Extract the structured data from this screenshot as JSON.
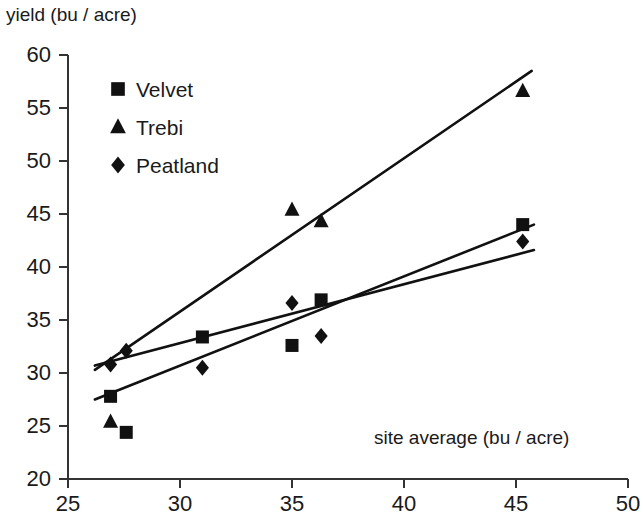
{
  "chart_data": {
    "type": "scatter",
    "title": "",
    "ylabel": "yield (bu / acre)",
    "xlabel": "site average (bu / acre)",
    "xlim": [
      25,
      50
    ],
    "ylim": [
      20,
      60
    ],
    "xticks": [
      25,
      30,
      35,
      40,
      45,
      50
    ],
    "yticks": [
      20,
      25,
      30,
      35,
      40,
      45,
      50,
      55,
      60
    ],
    "xtick_labels": [
      "25",
      "30",
      "35",
      "40",
      "45",
      "50"
    ],
    "ytick_labels": [
      "20",
      "25",
      "30",
      "35",
      "40",
      "45",
      "50",
      "55",
      "60"
    ],
    "grid": false,
    "legend_position": "upper-left-inside",
    "marker_color": "#111111",
    "line_color": "#111111",
    "axis_color": "#333333",
    "series": [
      {
        "name": "Velvet",
        "marker": "square",
        "x": [
          26.9,
          27.6,
          31.0,
          35.0,
          36.3,
          45.3
        ],
        "y": [
          27.8,
          24.4,
          33.4,
          32.6,
          36.9,
          44.0
        ],
        "trendline": {
          "x1": 26.2,
          "y1": 27.5,
          "x2": 45.8,
          "y2": 44.0
        }
      },
      {
        "name": "Trebi",
        "marker": "triangle",
        "x": [
          26.9,
          35.0,
          36.3,
          45.3
        ],
        "y": [
          25.4,
          45.4,
          44.3,
          56.6
        ],
        "trendline": {
          "x1": 26.2,
          "y1": 30.3,
          "x2": 45.7,
          "y2": 58.5
        }
      },
      {
        "name": "Peatland",
        "marker": "diamond",
        "x": [
          26.9,
          27.6,
          31.0,
          35.0,
          36.3,
          45.3
        ],
        "y": [
          30.8,
          32.1,
          30.5,
          36.6,
          33.5,
          42.4
        ],
        "trendline": {
          "x1": 26.2,
          "y1": 30.7,
          "x2": 45.8,
          "y2": 41.6
        }
      }
    ]
  },
  "legend": {
    "entries": [
      {
        "label": "Velvet",
        "marker": "square"
      },
      {
        "label": "Trebi",
        "marker": "triangle"
      },
      {
        "label": "Peatland",
        "marker": "diamond"
      }
    ]
  }
}
